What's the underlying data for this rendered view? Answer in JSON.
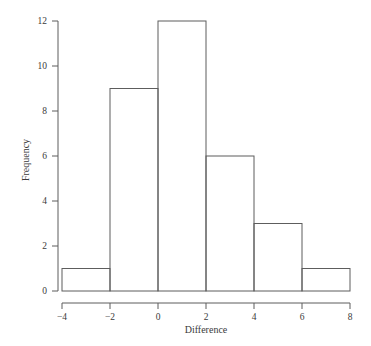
{
  "figure": {
    "background_color": "#ffffff",
    "line_color": "#5d5d5d",
    "text_color": "#3a3a3a"
  },
  "chart_data": {
    "type": "bar",
    "title": "",
    "subtitle": "",
    "xlabel": "Difference",
    "ylabel": "Frequency",
    "xlim": [
      -4,
      8
    ],
    "ylim": [
      0,
      12
    ],
    "grid": false,
    "legend": null,
    "bin_width": 2,
    "bin_edges": [
      -4,
      -2,
      0,
      2,
      4,
      6,
      8
    ],
    "categories": [
      "-4 to -2",
      "-2 to 0",
      "0 to 2",
      "2 to 4",
      "4 to 6",
      "6 to 8"
    ],
    "values": [
      1,
      9,
      12,
      6,
      3,
      1
    ],
    "bar_fill": "none",
    "bar_stroke": "#5d5d5d",
    "xticks": [
      -4,
      -2,
      0,
      2,
      4,
      6,
      8
    ],
    "xtick_labels": [
      "−4",
      "−2",
      "0",
      "2",
      "4",
      "6",
      "8"
    ],
    "yticks": [
      0,
      2,
      4,
      6,
      8,
      10,
      12
    ],
    "ytick_labels": [
      "0",
      "2",
      "4",
      "6",
      "8",
      "10",
      "12"
    ],
    "total_count": 32,
    "annotations": []
  }
}
